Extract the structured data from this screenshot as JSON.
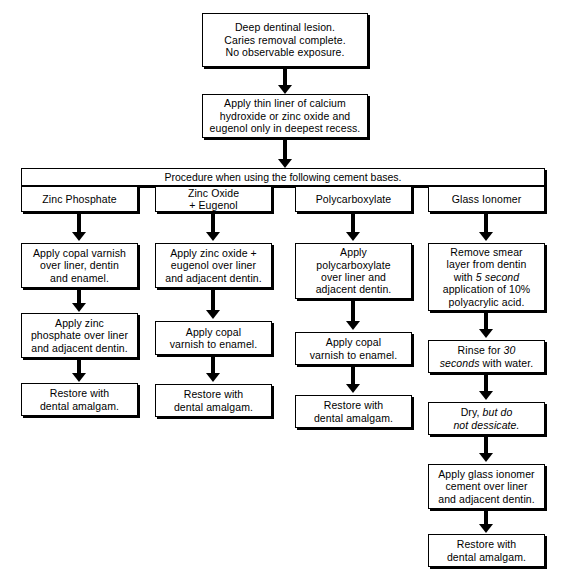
{
  "diagram": {
    "nodes": {
      "start": "Deep dentinal lesion.\nCaries removal complete.\nNo observable exposure.",
      "liner": "Apply thin liner of calcium\nhydroxide or zinc oxide and\neugenol only in deepest recess.",
      "band": "Procedure when using the following cement bases."
    },
    "columns": [
      {
        "header": "Zinc Phosphate",
        "steps": [
          "Apply copal varnish\nover liner, dentin\nand enamel.",
          "Apply zinc\nphosphate over liner\nand adjacent dentin.",
          "Restore with\ndental amalgam."
        ]
      },
      {
        "header": "Zinc Oxide\n+ Eugenol",
        "steps": [
          "Apply zinc oxide +\neugenol over liner\nand adjacent dentin.",
          "Apply copal\nvarnish to enamel.",
          "Restore with\ndental amalgam."
        ]
      },
      {
        "header": "Polycarboxylate",
        "steps": [
          "Apply\npolycarboxylate\nover liner and\nadjacent dentin.",
          "Apply copal\nvarnish to enamel.",
          "Restore with\ndental amalgam."
        ]
      },
      {
        "header": "Glass Ionomer",
        "steps": [
          "Remove smear\nlayer from dentin\nwith *5 second*\napplication of 10%\npolyacrylic acid.",
          "Rinse for *30\nseconds* with water.",
          "Dry, *but do\nnot dessicate.*",
          "Apply glass ionomer\ncement over liner\nand adjacent dentin.",
          "Restore with\ndental amalgam."
        ]
      }
    ]
  },
  "colors": {
    "ink": "#000000",
    "paper": "#ffffff"
  }
}
